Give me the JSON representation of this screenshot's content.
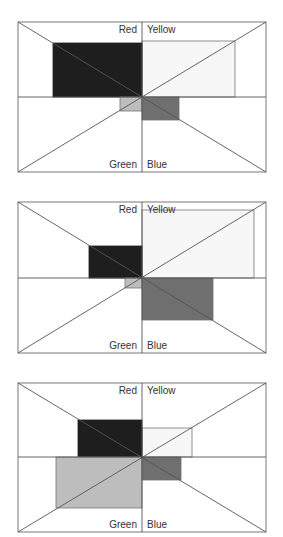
{
  "labels": {
    "top_left": "Red",
    "top_right": "Yellow",
    "bottom_left": "Green",
    "bottom_right": "Blue"
  },
  "colors": {
    "red": "#1e1e1e",
    "yellow": "#f7f7f7",
    "green": "#bdbdbd",
    "blue": "#6f6f6f",
    "line": "#555555"
  },
  "panels": [
    {
      "box": [
        18,
        22,
        266,
        172
      ],
      "center": [
        142,
        97
      ],
      "red": [
        53,
        43,
        142,
        97
      ],
      "yellow": [
        142,
        41,
        235,
        97
      ],
      "green": [
        120,
        97,
        142,
        111
      ],
      "blue": [
        142,
        97,
        179,
        120
      ]
    },
    {
      "box": [
        18,
        202,
        266,
        353
      ],
      "center": [
        142,
        278
      ],
      "red": [
        89,
        246,
        142,
        278
      ],
      "yellow": [
        142,
        210,
        254,
        278
      ],
      "green": [
        125,
        278,
        142,
        288
      ],
      "blue": [
        142,
        278,
        213,
        320
      ]
    },
    {
      "box": [
        18,
        383,
        266,
        532
      ],
      "center": [
        142,
        457
      ],
      "red": [
        78,
        420,
        142,
        457
      ],
      "yellow": [
        142,
        428,
        192,
        457
      ],
      "green": [
        56,
        457,
        142,
        508
      ],
      "blue": [
        142,
        457,
        181,
        480
      ]
    }
  ]
}
